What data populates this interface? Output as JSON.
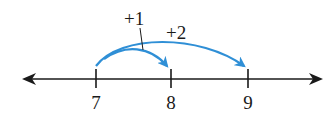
{
  "diagram": {
    "type": "number-line-addition",
    "colors": {
      "line": "#1a1a1a",
      "arc": "#2f8fd6",
      "background": "#ffffff"
    },
    "ticks": [
      {
        "value": "7",
        "x": 96
      },
      {
        "value": "8",
        "x": 171
      },
      {
        "value": "9",
        "x": 248
      }
    ],
    "jumps": [
      {
        "label": "+1",
        "from": "7",
        "to": "8"
      },
      {
        "label": "+2",
        "from": "7",
        "to": "9"
      }
    ]
  }
}
